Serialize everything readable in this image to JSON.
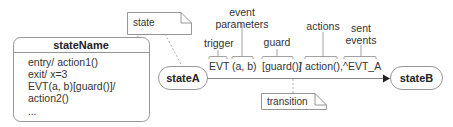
{
  "diagram": {
    "type": "uml-state-machine-notation",
    "state_note": {
      "label": "state"
    },
    "state_detail": {
      "name": "stateName",
      "internal_lines": [
        "entry/ action1()",
        "exit/ x=3",
        "EVT(a, b)[guard()]/",
        "action2()",
        "..."
      ]
    },
    "source_state": {
      "label": "stateA"
    },
    "target_state": {
      "label": "stateB"
    },
    "transition": {
      "segments": {
        "trigger": "EVT",
        "params": "(a, b)",
        "guard": "[guard()]",
        "slash": "/",
        "actions": "action(),",
        "sent": "^EVT_A"
      },
      "annotations": {
        "trigger": "trigger",
        "event_parameters_line1": "event",
        "event_parameters_line2": "parameters",
        "guard": "guard",
        "actions": "actions",
        "sent_events_line1": "sent",
        "sent_events_line2": "events"
      },
      "note": {
        "label": "transition"
      }
    },
    "colors": {
      "stroke": "#888888",
      "text": "#333333",
      "background": "#ffffff"
    }
  }
}
